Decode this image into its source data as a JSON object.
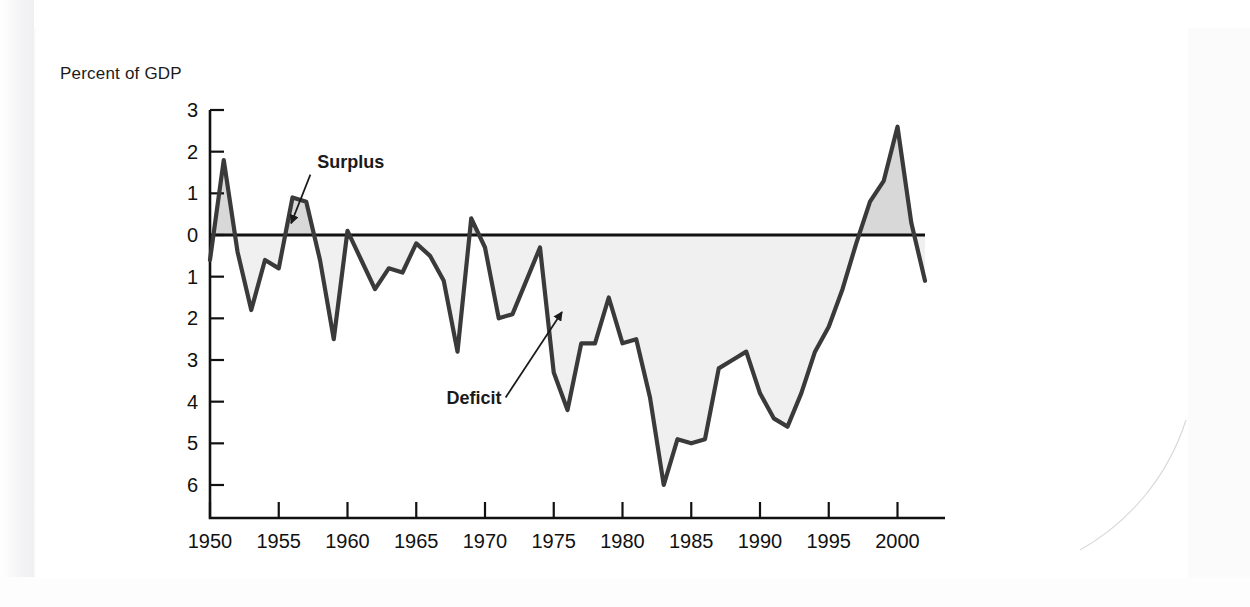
{
  "page": {
    "background_color": "#fbfbfc",
    "panel_color": "#ffffff"
  },
  "chart_data": {
    "type": "area",
    "title": "",
    "subtitle": "",
    "ylabel": "Percent of GDP",
    "xlabel": "",
    "grid": false,
    "legend_position": "inline-annotation",
    "xlim": [
      1950,
      2002
    ],
    "ylim": [
      -6.6,
      3.0
    ],
    "y_axis_note": "Values below zero are deficits; tick labels below the zero line are printed without a minus sign",
    "x_ticks": [
      1950,
      1955,
      1960,
      1965,
      1970,
      1975,
      1980,
      1985,
      1990,
      1995,
      2000
    ],
    "x_tick_labels": [
      "1950",
      "1955",
      "1960",
      "1965",
      "1970",
      "1975",
      "1980",
      "1985",
      "1990",
      "1995",
      "2000"
    ],
    "y_ticks": [
      3,
      2,
      1,
      0,
      -1,
      -2,
      -3,
      -4,
      -5,
      -6
    ],
    "y_tick_labels": [
      "3",
      "2",
      "1",
      "0",
      "1",
      "2",
      "3",
      "4",
      "5",
      "6"
    ],
    "series": [
      {
        "name": "Federal surplus or deficit",
        "line_color": "#3a3a3a",
        "positive_fill_color": "#d8d8d8",
        "negative_fill_color": "#f0f0f0",
        "x": [
          1950,
          1951,
          1952,
          1953,
          1954,
          1955,
          1956,
          1957,
          1958,
          1959,
          1960,
          1961,
          1962,
          1963,
          1964,
          1965,
          1966,
          1967,
          1968,
          1969,
          1970,
          1971,
          1972,
          1973,
          1974,
          1975,
          1976,
          1977,
          1978,
          1979,
          1980,
          1981,
          1982,
          1983,
          1984,
          1985,
          1986,
          1987,
          1988,
          1989,
          1990,
          1991,
          1992,
          1993,
          1994,
          1995,
          1996,
          1997,
          1998,
          1999,
          2000,
          2001,
          2002
        ],
        "values": [
          -0.6,
          1.8,
          -0.4,
          -1.8,
          -0.6,
          -0.8,
          0.9,
          0.8,
          -0.6,
          -2.5,
          0.1,
          -0.6,
          -1.3,
          -0.8,
          -0.9,
          -0.2,
          -0.5,
          -1.1,
          -2.8,
          0.4,
          -0.3,
          -2.0,
          -1.9,
          -1.1,
          -0.3,
          -3.3,
          -4.2,
          -2.6,
          -2.6,
          -1.5,
          -2.6,
          -2.5,
          -3.9,
          -6.0,
          -4.9,
          -5.0,
          -4.9,
          -3.2,
          -3.0,
          -2.8,
          -3.8,
          -4.4,
          -4.6,
          -3.8,
          -2.8,
          -2.2,
          -1.3,
          -0.2,
          0.8,
          1.3,
          2.6,
          0.3,
          -1.1
        ],
        "units": "percent of GDP"
      }
    ],
    "annotations": [
      {
        "label": "Surplus",
        "kind": "arrow-callout",
        "text_x": 1957.8,
        "text_y": 1.62,
        "arrow_from_x": 1957.3,
        "arrow_from_y": 1.45,
        "arrow_to_x": 1955.9,
        "arrow_to_y": 0.28,
        "bold": true
      },
      {
        "label": "Deficit",
        "kind": "arrow-callout",
        "text_x": 1967.2,
        "text_y": -4.05,
        "arrow_from_x": 1971.5,
        "arrow_from_y": -3.9,
        "arrow_to_x": 1975.6,
        "arrow_to_y": -1.85,
        "bold": true
      }
    ]
  }
}
